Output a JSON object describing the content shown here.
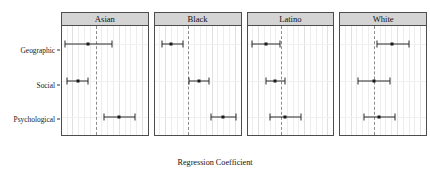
{
  "chart_data": {
    "type": "scatter",
    "subtype": "dot-and-whisker coefficient plot",
    "title": "",
    "xlabel": "Regression Coefficient",
    "ylabel": "",
    "xlim": [
      -0.145,
      0.225
    ],
    "xticks": [
      -0.1,
      0.0,
      0.1,
      0.2
    ],
    "xticklabels": [
      "-0.1",
      "0.0",
      "0.1",
      "0.2"
    ],
    "categories": [
      "Geographic",
      "Social",
      "Psychological"
    ],
    "facet_labels": [
      "Asian",
      "Black",
      "Latino",
      "White"
    ],
    "reference_line": 0.0,
    "grid": true,
    "legend": "none",
    "panels": [
      {
        "label": "Asian",
        "points": [
          {
            "category": "Geographic",
            "estimate": -0.031,
            "low": -0.131,
            "high": 0.07
          },
          {
            "category": "Social",
            "estimate": -0.078,
            "low": -0.124,
            "high": -0.033
          },
          {
            "category": "Psychological",
            "estimate": 0.103,
            "low": 0.038,
            "high": 0.17
          }
        ]
      },
      {
        "label": "Black",
        "points": [
          {
            "category": "Geographic",
            "estimate": -0.074,
            "low": -0.115,
            "high": -0.022
          },
          {
            "category": "Social",
            "estimate": 0.044,
            "low": 0.002,
            "high": 0.09
          },
          {
            "category": "Psychological",
            "estimate": 0.15,
            "low": 0.096,
            "high": 0.206
          }
        ]
      },
      {
        "label": "Latino",
        "points": [
          {
            "category": "Geographic",
            "estimate": -0.066,
            "low": -0.127,
            "high": -0.003
          },
          {
            "category": "Social",
            "estimate": -0.025,
            "low": -0.065,
            "high": 0.018
          },
          {
            "category": "Psychological",
            "estimate": 0.018,
            "low": -0.048,
            "high": 0.084
          }
        ]
      },
      {
        "label": "White",
        "points": [
          {
            "category": "Geographic",
            "estimate": 0.08,
            "low": 0.012,
            "high": 0.152
          },
          {
            "category": "Social",
            "estimate": 0.001,
            "low": -0.069,
            "high": 0.068
          },
          {
            "category": "Psychological",
            "estimate": 0.022,
            "low": -0.043,
            "high": 0.093
          }
        ]
      }
    ]
  },
  "style": {
    "strip_fill": "#d4d4d4",
    "panel_border": "#4d4d4d",
    "point_color": "#1a1a1a",
    "errorbar_color": "#2b2b2b",
    "grid_color": "#ededed",
    "zero_line_color": "#8c8c8c",
    "background": "#ffffff"
  }
}
